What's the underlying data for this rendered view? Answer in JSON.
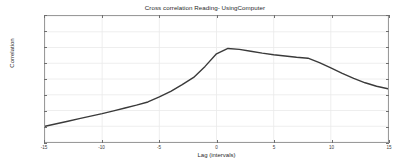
{
  "chart_data": {
    "type": "line",
    "title": "Cross correlation Reading- UsingComputer",
    "xlabel": "Lag (intervals)",
    "ylabel": "Correlation",
    "xlim": [
      -15,
      15
    ],
    "ylim": [
      0.39,
      0.43
    ],
    "grid": true,
    "legend": null,
    "xticks": [
      -15,
      -10,
      -5,
      0,
      5,
      10,
      15
    ],
    "xtick_labels": [
      "-15",
      "-10",
      "-5",
      "0",
      "5",
      "10",
      "15"
    ],
    "yticks": [
      0.39,
      0.395,
      0.4,
      0.405,
      0.41,
      0.415,
      0.42,
      0.425,
      0.43
    ],
    "ytick_labels": [
      "0.39",
      "0.395",
      "0.4",
      "0.405",
      "0.41",
      "0.415",
      "0.42",
      "0.425",
      "0.43"
    ],
    "series": [
      {
        "name": "cross-correlation",
        "color": "#3a3a3a",
        "line_width": 1.4,
        "x": [
          -15,
          -14,
          -13,
          -12,
          -11,
          -10,
          -9,
          -8,
          -7,
          -6,
          -5,
          -4,
          -3,
          -2,
          -1,
          0,
          1,
          2,
          3,
          4,
          5,
          6,
          7,
          8,
          9,
          10,
          11,
          12,
          13,
          14,
          15
        ],
        "y": [
          0.395,
          0.3958,
          0.3966,
          0.3974,
          0.3982,
          0.399,
          0.3999,
          0.4008,
          0.4017,
          0.4027,
          0.4043,
          0.4061,
          0.4082,
          0.4105,
          0.414,
          0.418,
          0.4197,
          0.4194,
          0.4188,
          0.4182,
          0.4177,
          0.4173,
          0.4169,
          0.4166,
          0.4152,
          0.4135,
          0.4118,
          0.4102,
          0.4088,
          0.4077,
          0.4069
        ]
      }
    ]
  }
}
